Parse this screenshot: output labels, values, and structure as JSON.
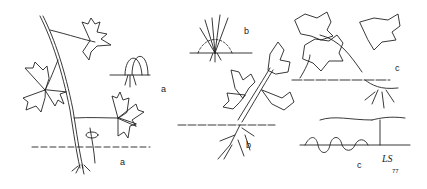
{
  "figure": {
    "labels": {
      "a_small": "a",
      "a_large": "a",
      "b_small": "b",
      "b_large": "b",
      "c_upper": "c",
      "c_lower": "c"
    },
    "signature": "LS",
    "signature_year": "77",
    "line_color": "#222222",
    "background": "#ffffff"
  }
}
